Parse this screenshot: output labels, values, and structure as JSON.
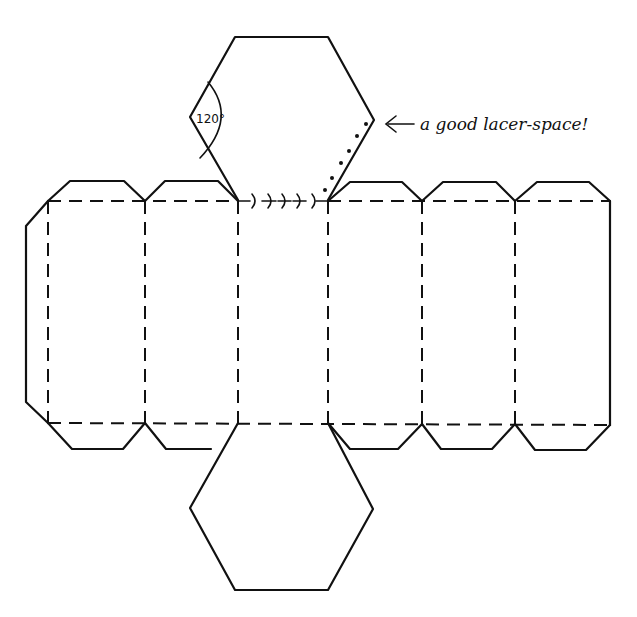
{
  "diagram": {
    "type": "hexagonal-prism-net",
    "angle_label": "120°",
    "annotation": {
      "arrow": "←",
      "text": "a good lacer-space!"
    },
    "panels": 6,
    "colors": {
      "line": "#111111",
      "background": "#ffffff"
    }
  }
}
